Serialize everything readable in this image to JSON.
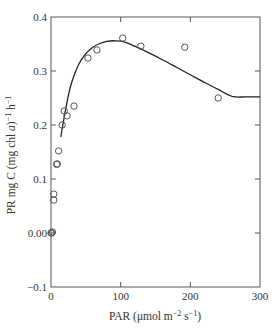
{
  "chart_data": {
    "type": "scatter",
    "title": "",
    "xlabel": "PAR (μmol m⁻² s⁻¹)",
    "ylabel": "PR mg C (mg chl a)⁻¹ h⁻¹",
    "xlabel_parts": {
      "main": "PAR (μmol m",
      "sup1": "−2",
      "mid": " s",
      "sup2": "−1",
      "end": ")"
    },
    "ylabel_parts": {
      "pre": "PR mg C (mg chl ",
      "italic": "a",
      "post": ")",
      "sup1": "−1",
      "mid": " h",
      "sup2": "−1"
    },
    "xlim": [
      0,
      300
    ],
    "ylim": [
      -0.1,
      0.4
    ],
    "xticks": [
      0,
      100,
      200,
      300
    ],
    "xtick_labels": [
      "0",
      "100",
      "200",
      "300"
    ],
    "yticks": [
      -0.1,
      0.0,
      0.1,
      0.2,
      0.3,
      0.4
    ],
    "ytick_labels": [
      "−0.1",
      "0.00",
      "0.1",
      "0.2",
      "0.3",
      "0.4"
    ],
    "grid": false,
    "legend": null,
    "series": [
      {
        "name": "observations",
        "kind": "scatter",
        "marker": "open-circle",
        "points": [
          [
            0,
            0.0
          ],
          [
            1,
            0.0
          ],
          [
            2,
            0.002
          ],
          [
            4,
            0.061
          ],
          [
            4,
            0.072
          ],
          [
            8,
            0.127
          ],
          [
            9,
            0.128
          ],
          [
            11,
            0.152
          ],
          [
            16,
            0.2
          ],
          [
            19,
            0.226
          ],
          [
            23,
            0.217
          ],
          [
            33,
            0.235
          ],
          [
            53,
            0.324
          ],
          [
            66,
            0.339
          ],
          [
            103,
            0.361
          ],
          [
            129,
            0.346
          ],
          [
            192,
            0.344
          ],
          [
            240,
            0.25
          ]
        ]
      },
      {
        "name": "fitted curve",
        "kind": "line",
        "points": [
          [
            14,
            0.178
          ],
          [
            20,
            0.222
          ],
          [
            25,
            0.255
          ],
          [
            30,
            0.28
          ],
          [
            40,
            0.313
          ],
          [
            50,
            0.332
          ],
          [
            60,
            0.344
          ],
          [
            70,
            0.351
          ],
          [
            80,
            0.355
          ],
          [
            92,
            0.356
          ],
          [
            105,
            0.354
          ],
          [
            120,
            0.346
          ],
          [
            140,
            0.334
          ],
          [
            160,
            0.321
          ],
          [
            180,
            0.307
          ],
          [
            200,
            0.293
          ],
          [
            220,
            0.279
          ],
          [
            240,
            0.266
          ],
          [
            260,
            0.253
          ],
          [
            280,
            0.252
          ],
          [
            300,
            0.252
          ]
        ]
      }
    ]
  }
}
